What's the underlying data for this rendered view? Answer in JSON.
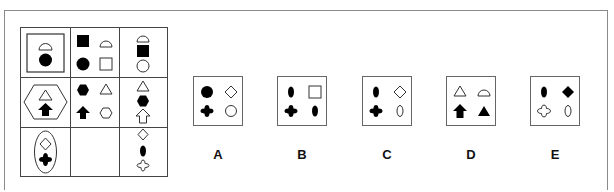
{
  "puzzle": {
    "type": "3x3 matrix completion",
    "grid": [
      [
        {
          "container": "square",
          "shapes": [
            "semicircle-outline",
            "circle-filled"
          ]
        },
        {
          "container": "none",
          "shapes": [
            "square-filled",
            "semicircle-outline",
            "circle-filled",
            "square-outline"
          ]
        },
        {
          "container": "none",
          "shapes": [
            "semicircle-outline",
            "square-filled",
            "circle-outline"
          ]
        }
      ],
      [
        {
          "container": "hexagon",
          "shapes": [
            "triangle-outline",
            "arrow-up-filled"
          ]
        },
        {
          "container": "none",
          "shapes": [
            "hexagon-filled",
            "triangle-outline",
            "arrow-up-filled",
            "hexagon-outline"
          ]
        },
        {
          "container": "none",
          "shapes": [
            "triangle-outline",
            "hexagon-filled",
            "arrow-up-outline"
          ]
        }
      ],
      [
        {
          "container": "ellipse",
          "shapes": [
            "diamond-outline",
            "cross-filled"
          ]
        },
        {
          "container": "none",
          "shapes": [],
          "missing": true
        },
        {
          "container": "none",
          "shapes": [
            "diamond-outline",
            "ellipse-filled",
            "cross-outline"
          ]
        }
      ]
    ],
    "options": [
      {
        "label": "A",
        "shapes": [
          "circle-filled",
          "diamond-outline",
          "cross-filled",
          "circle-outline"
        ]
      },
      {
        "label": "B",
        "shapes": [
          "ellipse-filled",
          "square-outline",
          "cross-filled",
          "ellipse-filled"
        ]
      },
      {
        "label": "C",
        "shapes": [
          "ellipse-filled",
          "diamond-outline",
          "cross-filled",
          "ellipse-outline"
        ]
      },
      {
        "label": "D",
        "shapes": [
          "triangle-outline",
          "semicircle-outline",
          "arrow-up-filled",
          "triangle-filled"
        ]
      },
      {
        "label": "E",
        "shapes": [
          "ellipse-filled",
          "diamond-filled",
          "cross-outline",
          "ellipse-outline"
        ]
      }
    ]
  },
  "colors": {
    "ink": "#000000",
    "frame": "#8a8a8a",
    "grid": "#444444"
  }
}
